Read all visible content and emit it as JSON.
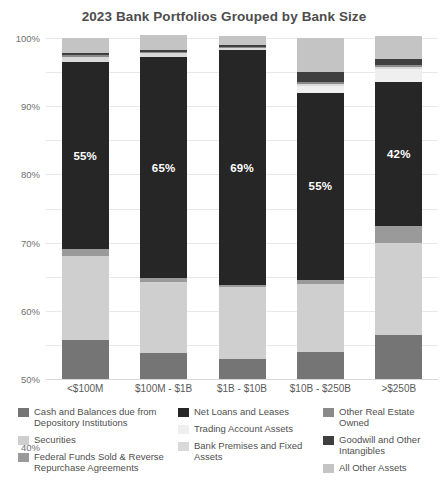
{
  "chart_data": {
    "type": "bar",
    "subtype": "stacked-bar-100-percent",
    "title": "2023 Bank Portfolios Grouped by Bank Size",
    "xlabel": "",
    "ylabel": "",
    "ylim": [
      0,
      100
    ],
    "grid": true,
    "legend_position": "bottom",
    "categories": [
      "<$100M",
      "$100M - $1B",
      "$1B - $10B",
      "$10B - $250B",
      ">$250B"
    ],
    "ytick_labels": [
      "100%",
      "90%",
      "80%",
      "70%",
      "60%",
      "50%",
      "40%",
      "30%",
      "20%",
      "10%",
      "0%"
    ],
    "ytick_values": [
      100,
      90,
      80,
      70,
      60,
      50,
      40,
      30,
      20,
      10,
      0
    ],
    "series": [
      {
        "name": "Cash and Balances due from Depository Institutions",
        "color": "#757575",
        "values": [
          11.5,
          7.5,
          6.0,
          8.0,
          13.0
        ]
      },
      {
        "name": "Securities",
        "color": "#cfcfcf",
        "values": [
          24.5,
          21.0,
          21.0,
          20.0,
          27.0
        ]
      },
      {
        "name": "Federal Funds Sold & Reverse Repurchase Agreements",
        "color": "#9a9a9a",
        "values": [
          2.0,
          1.0,
          0.5,
          1.0,
          5.0
        ]
      },
      {
        "name": "Net Loans and Leases",
        "color": "#262626",
        "values": [
          55.0,
          65.0,
          69.0,
          55.0,
          42.0
        ],
        "data_labels": [
          "55%",
          "65%",
          "69%",
          "55%",
          "42%"
        ]
      },
      {
        "name": "Trading Account Assets",
        "color": "#efefef",
        "values": [
          0.0,
          0.0,
          0.0,
          2.0,
          4.0
        ]
      },
      {
        "name": "Bank Premises and Fixed Assets",
        "color": "#d9d9d9",
        "values": [
          1.5,
          1.0,
          0.5,
          0.5,
          0.5
        ]
      },
      {
        "name": "Other Real Estate Owned",
        "color": "#8a8a8a",
        "values": [
          0.5,
          0.5,
          0.5,
          0.5,
          0.5
        ]
      },
      {
        "name": "Goodwill and Other Intangibles",
        "color": "#3f3f3f",
        "values": [
          0.5,
          0.5,
          0.5,
          3.0,
          2.0
        ]
      },
      {
        "name": "All Other Assets",
        "color": "#c4c4c4",
        "values": [
          4.5,
          4.5,
          2.5,
          10.0,
          6.5
        ]
      }
    ],
    "legend": [
      {
        "label": "Cash and Balances due from Depository Institutions",
        "color": "#757575"
      },
      {
        "label": "Net Loans and Leases",
        "color": "#262626"
      },
      {
        "label": "Other Real Estate Owned",
        "color": "#8a8a8a"
      },
      {
        "label": "Securities",
        "color": "#cfcfcf"
      },
      {
        "label": "Trading Account Assets",
        "color": "#efefef"
      },
      {
        "label": "Goodwill and Other Intangibles",
        "color": "#3f3f3f"
      },
      {
        "label": "Federal Funds Sold & Reverse Repurchase Agreements",
        "color": "#9a9a9a"
      },
      {
        "label": "Bank Premises and Fixed Assets",
        "color": "#d9d9d9"
      },
      {
        "label": "All Other Assets",
        "color": "#c4c4c4"
      }
    ],
    "legend_columns": [
      [
        {
          "label": "Cash and Balances due from Depository Institutions",
          "color": "#757575"
        },
        {
          "label": "Securities",
          "color": "#cfcfcf"
        },
        {
          "label": "Federal Funds Sold & Reverse Repurchase Agreements",
          "color": "#9a9a9a"
        }
      ],
      [
        {
          "label": "Net Loans and Leases",
          "color": "#262626"
        },
        {
          "label": "Trading Account Assets",
          "color": "#efefef"
        },
        {
          "label": "Bank Premises and Fixed Assets",
          "color": "#d9d9d9"
        }
      ],
      [
        {
          "label": "Other Real Estate Owned",
          "color": "#8a8a8a"
        },
        {
          "label": "Goodwill and Other Intangibles",
          "color": "#3f3f3f"
        },
        {
          "label": "All Other Assets",
          "color": "#c4c4c4"
        }
      ]
    ]
  }
}
